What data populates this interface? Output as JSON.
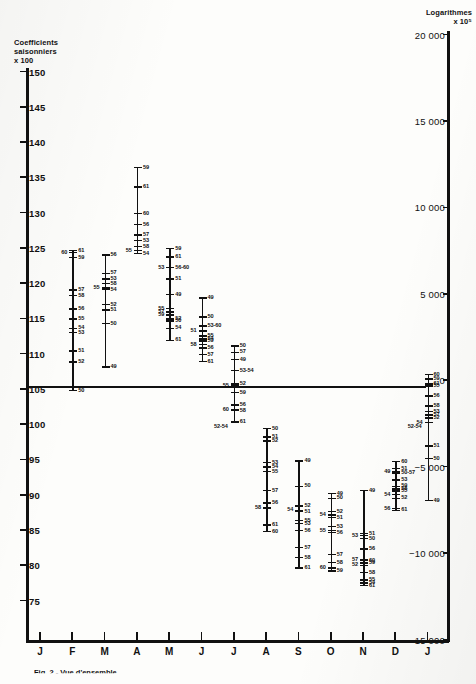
{
  "figure": {
    "caption": "Fig. 2 - Vue d'ensemble",
    "left_axis_title": "Coefficients\nsaisonniers\nx 100",
    "right_axis_title": "Logarithmes\nx 10⁵"
  },
  "chart_data": {
    "type": "scatter",
    "title": "",
    "xlabel": "",
    "ylabel": "Coefficients saisonniers x 100",
    "ylabel_right": "Logarithmes x 10⁵",
    "ylim": [
      75,
      150
    ],
    "ylim_right": [
      -15000,
      20000
    ],
    "grid": false,
    "legend": null,
    "baseline": 100,
    "left_ticks": [
      150,
      145,
      140,
      135,
      130,
      125,
      120,
      115,
      110,
      105,
      100,
      95,
      90,
      85,
      80,
      75
    ],
    "left_tick_labels": [
      "150",
      "145",
      "140",
      "135",
      "130",
      "125",
      "120",
      "115",
      "110",
      "105",
      "100",
      "95",
      "90",
      "85",
      "80",
      "75"
    ],
    "right_ticks": [
      20000,
      15000,
      10000,
      5000,
      0,
      -5000,
      -10000,
      -15000
    ],
    "right_tick_labels": [
      "20 000",
      "15 000",
      "10 000",
      "5 000",
      "0",
      "−5 000",
      "−10 000",
      "−15 000"
    ],
    "x_tick_labels": [
      "J",
      "F",
      "M",
      "A",
      "M",
      "J",
      "J",
      "A",
      "S",
      "O",
      "N",
      "D",
      "J"
    ],
    "series_note": "Each month column plots one point per year, labelled by the last two digits of the year (49–61).",
    "months": [
      {
        "label": "J",
        "points": []
      },
      {
        "label": "F",
        "points": [
          {
            "year": "61",
            "value": 124.6,
            "side": "right"
          },
          {
            "year": "60",
            "value": 124.3,
            "side": "left"
          },
          {
            "year": "59",
            "value": 123.6,
            "side": "right"
          },
          {
            "year": "57",
            "value": 119.0,
            "side": "right"
          },
          {
            "year": "58",
            "value": 118.2,
            "side": "right"
          },
          {
            "year": "56",
            "value": 116.3,
            "side": "right"
          },
          {
            "year": "55",
            "value": 114.9,
            "side": "right"
          },
          {
            "year": "54",
            "value": 113.6,
            "side": "right"
          },
          {
            "year": "53",
            "value": 113.0,
            "side": "right"
          },
          {
            "year": "51",
            "value": 110.4,
            "side": "right"
          },
          {
            "year": "52",
            "value": 108.8,
            "side": "right"
          },
          {
            "year": "50",
            "value": 104.8,
            "side": "right"
          }
        ]
      },
      {
        "label": "M",
        "points": [
          {
            "year": "56",
            "value": 124.0,
            "side": "right"
          },
          {
            "year": "57",
            "value": 121.4,
            "side": "right"
          },
          {
            "year": "53",
            "value": 120.6,
            "side": "right"
          },
          {
            "year": "58",
            "value": 119.9,
            "side": "right"
          },
          {
            "year": "55",
            "value": 119.3,
            "side": "left"
          },
          {
            "year": "54",
            "value": 119.1,
            "side": "right"
          },
          {
            "year": "52",
            "value": 117.0,
            "side": "right"
          },
          {
            "year": "51",
            "value": 116.2,
            "side": "right"
          },
          {
            "year": "50",
            "value": 114.3,
            "side": "right"
          },
          {
            "year": "49",
            "value": 108.1,
            "side": "right"
          }
        ]
      },
      {
        "label": "A",
        "points": [
          {
            "year": "59",
            "value": 136.4,
            "side": "right"
          },
          {
            "year": "61",
            "value": 133.6,
            "side": "right"
          },
          {
            "year": "60",
            "value": 129.9,
            "side": "right"
          },
          {
            "year": "56",
            "value": 128.3,
            "side": "right"
          },
          {
            "year": "57",
            "value": 126.8,
            "side": "right"
          },
          {
            "year": "53",
            "value": 126.0,
            "side": "right"
          },
          {
            "year": "58",
            "value": 125.2,
            "side": "right"
          },
          {
            "year": "55",
            "value": 124.6,
            "side": "left"
          },
          {
            "year": "54",
            "value": 124.2,
            "side": "right"
          }
        ]
      },
      {
        "label": "M",
        "points": [
          {
            "year": "59",
            "value": 124.9,
            "side": "right"
          },
          {
            "year": "61",
            "value": 123.7,
            "side": "right"
          },
          {
            "year": "53",
            "value": 122.2,
            "side": "left"
          },
          {
            "year": "56",
            "value": 122.2,
            "side": "right"
          },
          {
            "year": "58",
            "value": 122.2,
            "side": "right"
          },
          {
            "year": "60",
            "value": 122.2,
            "side": "right"
          },
          {
            "year": "51",
            "value": 120.6,
            "side": "right"
          },
          {
            "year": "49",
            "value": 118.4,
            "side": "right"
          },
          {
            "year": "55",
            "value": 116.4,
            "side": "left"
          },
          {
            "year": "57",
            "value": 115.9,
            "side": "left"
          },
          {
            "year": "59",
            "value": 115.5,
            "side": "left"
          },
          {
            "year": "52",
            "value": 114.9,
            "side": "right"
          },
          {
            "year": "50",
            "value": 114.6,
            "side": "right"
          },
          {
            "year": "54",
            "value": 113.6,
            "side": "right"
          },
          {
            "year": "61",
            "value": 111.9,
            "side": "right"
          }
        ]
      },
      {
        "label": "J",
        "points": [
          {
            "year": "49",
            "value": 117.9,
            "side": "right"
          },
          {
            "year": "50",
            "value": 115.2,
            "side": "right"
          },
          {
            "year": "53",
            "value": 113.9,
            "side": "right"
          },
          {
            "year": "60",
            "value": 113.9,
            "side": "right"
          },
          {
            "year": "51",
            "value": 113.2,
            "side": "left"
          },
          {
            "year": "55",
            "value": 112.5,
            "side": "right"
          },
          {
            "year": "54",
            "value": 112.1,
            "side": "right"
          },
          {
            "year": "59",
            "value": 111.8,
            "side": "right"
          },
          {
            "year": "58",
            "value": 111.3,
            "side": "left"
          },
          {
            "year": "56",
            "value": 110.8,
            "side": "right"
          },
          {
            "year": "57",
            "value": 109.9,
            "side": "right"
          },
          {
            "year": "61",
            "value": 108.9,
            "side": "right"
          }
        ]
      },
      {
        "label": "J",
        "points": [
          {
            "year": "50",
            "value": 111.1,
            "side": "right"
          },
          {
            "year": "57",
            "value": 110.2,
            "side": "right"
          },
          {
            "year": "49",
            "value": 109.2,
            "side": "right"
          },
          {
            "year": "53",
            "value": 107.6,
            "side": "right"
          },
          {
            "year": "54",
            "value": 107.6,
            "side": "right"
          },
          {
            "year": "52",
            "value": 105.7,
            "side": "right"
          },
          {
            "year": "55",
            "value": 105.5,
            "side": "left"
          },
          {
            "year": "59",
            "value": 104.5,
            "side": "right"
          },
          {
            "year": "56",
            "value": 102.7,
            "side": "right"
          },
          {
            "year": "60",
            "value": 102.0,
            "side": "left"
          },
          {
            "year": "58",
            "value": 101.9,
            "side": "right"
          },
          {
            "year": "61",
            "value": 100.3,
            "side": "right"
          }
        ]
      },
      {
        "label": "A",
        "points": [
          {
            "year": "50",
            "value": 99.4,
            "side": "right"
          },
          {
            "year": "51",
            "value": 98.2,
            "side": "right"
          },
          {
            "year": "52",
            "value": 97.6,
            "side": "right"
          },
          {
            "year": "53",
            "value": 94.6,
            "side": "right"
          },
          {
            "year": "54",
            "value": 93.9,
            "side": "right"
          },
          {
            "year": "55",
            "value": 93.3,
            "side": "right"
          },
          {
            "year": "57",
            "value": 90.6,
            "side": "right"
          },
          {
            "year": "56",
            "value": 88.8,
            "side": "right"
          },
          {
            "year": "58",
            "value": 88.1,
            "side": "left"
          },
          {
            "year": "61",
            "value": 85.7,
            "side": "right"
          },
          {
            "year": "60",
            "value": 84.8,
            "side": "right"
          }
        ]
      },
      {
        "label": "S",
        "points": [
          {
            "year": "49",
            "value": 94.8,
            "side": "right"
          },
          {
            "year": "50",
            "value": 91.2,
            "side": "right"
          },
          {
            "year": "52",
            "value": 88.4,
            "side": "right"
          },
          {
            "year": "54",
            "value": 87.8,
            "side": "left"
          },
          {
            "year": "51",
            "value": 87.6,
            "side": "right"
          },
          {
            "year": "55",
            "value": 86.3,
            "side": "right"
          },
          {
            "year": "53",
            "value": 85.9,
            "side": "right"
          },
          {
            "year": "56",
            "value": 84.9,
            "side": "right"
          },
          {
            "year": "57",
            "value": 82.5,
            "side": "right"
          },
          {
            "year": "58",
            "value": 81.1,
            "side": "right"
          },
          {
            "year": "61",
            "value": 79.6,
            "side": "right"
          }
        ]
      },
      {
        "label": "O",
        "points": [
          {
            "year": "49",
            "value": 90.2,
            "side": "right"
          },
          {
            "year": "50",
            "value": 89.5,
            "side": "right"
          },
          {
            "year": "52",
            "value": 87.6,
            "side": "right"
          },
          {
            "year": "54",
            "value": 87.1,
            "side": "left"
          },
          {
            "year": "51",
            "value": 86.8,
            "side": "right"
          },
          {
            "year": "53",
            "value": 85.5,
            "side": "right"
          },
          {
            "year": "55",
            "value": 84.9,
            "side": "left"
          },
          {
            "year": "56",
            "value": 84.6,
            "side": "right"
          },
          {
            "year": "57",
            "value": 81.5,
            "side": "right"
          },
          {
            "year": "58",
            "value": 80.4,
            "side": "right"
          },
          {
            "year": "60",
            "value": 79.6,
            "side": "left"
          },
          {
            "year": "59",
            "value": 79.2,
            "side": "right"
          }
        ]
      },
      {
        "label": "N",
        "points": [
          {
            "year": "49",
            "value": 90.6,
            "side": "right"
          },
          {
            "year": "51",
            "value": 84.5,
            "side": "right"
          },
          {
            "year": "53",
            "value": 84.2,
            "side": "left"
          },
          {
            "year": "50",
            "value": 83.8,
            "side": "right"
          },
          {
            "year": "56",
            "value": 82.3,
            "side": "right"
          },
          {
            "year": "57",
            "value": 80.8,
            "side": "left"
          },
          {
            "year": "60",
            "value": 80.7,
            "side": "right"
          },
          {
            "year": "59",
            "value": 80.3,
            "side": "right"
          },
          {
            "year": "52",
            "value": 80.0,
            "side": "left"
          },
          {
            "year": "58",
            "value": 79.0,
            "side": "right"
          },
          {
            "year": "55",
            "value": 77.9,
            "side": "right"
          },
          {
            "year": "54",
            "value": 77.5,
            "side": "right"
          },
          {
            "year": "61",
            "value": 77.1,
            "side": "right"
          }
        ]
      },
      {
        "label": "D",
        "points": [
          {
            "year": "60",
            "value": 94.7,
            "side": "right"
          },
          {
            "year": "51",
            "value": 93.7,
            "side": "right"
          },
          {
            "year": "49",
            "value": 93.3,
            "side": "left"
          },
          {
            "year": "50",
            "value": 93.1,
            "side": "right"
          },
          {
            "year": "57",
            "value": 93.1,
            "side": "right"
          },
          {
            "year": "53",
            "value": 92.1,
            "side": "right"
          },
          {
            "year": "59",
            "value": 91.2,
            "side": "right"
          },
          {
            "year": "58",
            "value": 90.8,
            "side": "right"
          },
          {
            "year": "55",
            "value": 90.5,
            "side": "right"
          },
          {
            "year": "54",
            "value": 90.0,
            "side": "left"
          },
          {
            "year": "52",
            "value": 89.5,
            "side": "right"
          },
          {
            "year": "56",
            "value": 88.0,
            "side": "left"
          },
          {
            "year": "61",
            "value": 87.8,
            "side": "right"
          }
        ]
      },
      {
        "label": "J",
        "points": [
          {
            "year": "60",
            "value": 107.0,
            "side": "right"
          },
          {
            "year": "59",
            "value": 106.4,
            "side": "right"
          },
          {
            "year": "61",
            "value": 105.7,
            "side": "right"
          },
          {
            "year": "55",
            "value": 105.4,
            "side": "right"
          },
          {
            "year": "56",
            "value": 104.0,
            "side": "right"
          },
          {
            "year": "58",
            "value": 102.6,
            "side": "right"
          },
          {
            "year": "53",
            "value": 101.8,
            "side": "right"
          },
          {
            "year": "57",
            "value": 101.3,
            "side": "right"
          },
          {
            "year": "52",
            "value": 100.9,
            "side": "right"
          },
          {
            "year": "54",
            "value": 100.2,
            "side": "left"
          },
          {
            "year": "51",
            "value": 96.9,
            "side": "right"
          },
          {
            "year": "50",
            "value": 95.1,
            "side": "right"
          },
          {
            "year": "49",
            "value": 89.2,
            "side": "right"
          }
        ]
      }
    ],
    "annotations": [
      {
        "text": "52-54",
        "value": 99.6,
        "month_index": 6,
        "side": "left"
      },
      {
        "text": "52-54",
        "value": 99.6,
        "month_index": 12,
        "side": "left"
      }
    ]
  }
}
